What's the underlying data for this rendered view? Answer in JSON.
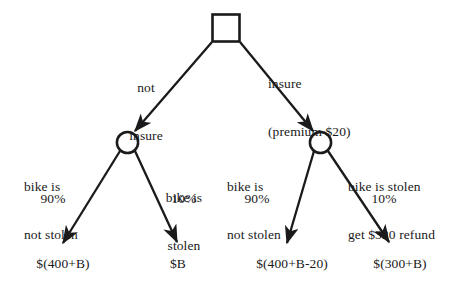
{
  "diagram": {
    "type": "decision-tree",
    "title": "",
    "nodes": {
      "root": {
        "shape": "square",
        "label": ""
      },
      "chance_left": {
        "shape": "circle",
        "label": ""
      },
      "chance_right": {
        "shape": "circle",
        "label": ""
      }
    },
    "decision_branches": {
      "left": {
        "line1": "not",
        "line2": "insure"
      },
      "right": {
        "line1": "insure",
        "line2": "(premium $20)"
      }
    },
    "outcome_branches": {
      "left_left": {
        "line1": "bike is",
        "line2": "not stolen",
        "probability": "90%"
      },
      "left_right": {
        "line1": "bike is",
        "line2": "stolen",
        "probability": "10%"
      },
      "right_left": {
        "line1": "bike is",
        "line2": "not stolen",
        "probability": "90%"
      },
      "right_right": {
        "line1": "bike is stolen",
        "line2": "get $320 refund",
        "probability": "10%"
      }
    },
    "leaves": {
      "left_left": "$(400+B)",
      "left_right": "$B",
      "right_left": "$(400+B-20)",
      "right_right": "$(300+B)"
    },
    "colors": {
      "stroke": "#1a1a1a",
      "text": "#1a1a1a",
      "background": "#ffffff"
    }
  }
}
